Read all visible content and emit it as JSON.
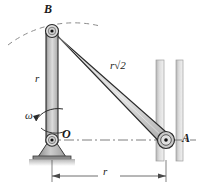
{
  "figure": {
    "type": "mechanism-kinematics-diagram",
    "labels": {
      "point_b": "B",
      "point_o": "O",
      "point_a": "A",
      "crank_length": "r",
      "link_length_prefix": "r",
      "link_length_radical": "√2",
      "link_length_full": "r√2",
      "angular_velocity": "ω",
      "horizontal_dimension": "r"
    },
    "geometry": {
      "pivot_o": {
        "x": 52,
        "y": 140
      },
      "pivot_b": {
        "x": 52,
        "y": 31
      },
      "pivot_a": {
        "x": 166,
        "y": 140
      },
      "crank_ob_length_px": 109,
      "link_ba_length_px": 161,
      "horizontal_span_px": 114,
      "guide_rail_left_x": 156,
      "guide_rail_right_x": 176,
      "guide_rail_top_y": 60,
      "guide_rail_bottom_y": 160,
      "dimension_line_y": 176,
      "arc_radius_px": 109
    },
    "colors": {
      "bar_fill": "#b8b8b8",
      "bar_fill_light": "#d6d6d6",
      "bar_stroke": "#2b2b2b",
      "rail_fill": "#cfcfcf",
      "ground_hatch": "#9a9a9a",
      "centerline": "#707070",
      "dashed_arc": "#8c8c8c",
      "label_color": "#1a1a1a",
      "background": "#ffffff"
    }
  }
}
